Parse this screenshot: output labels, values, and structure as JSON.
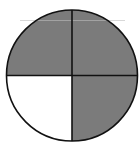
{
  "diagram": {
    "type": "fraction-circle",
    "parts_total": 4,
    "parts_shaded": 3,
    "center": [
      72,
      75.5
    ],
    "radius": 65.5,
    "colors": {
      "shaded": "#7b7b7b",
      "unshaded": "#ffffff",
      "stroke": "#111111",
      "background": "#ffffff"
    },
    "quadrants": [
      {
        "name": "top-left",
        "shaded": true
      },
      {
        "name": "top-right",
        "shaded": true
      },
      {
        "name": "bottom-right",
        "shaded": true
      },
      {
        "name": "bottom-left",
        "shaded": false
      }
    ]
  }
}
